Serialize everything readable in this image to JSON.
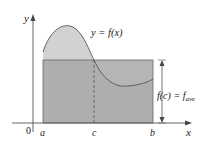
{
  "figure": {
    "curve_label": "y = f(x)",
    "height_label_main": "f(c) = f",
    "height_label_sub": "ave",
    "axis_x_label": "x",
    "axis_y_label": "y",
    "origin_label": "0",
    "tick_labels": [
      "a",
      "c",
      "b"
    ],
    "colors": {
      "rectangle_fill": "#a9a9a9",
      "curve_fill": "#cfcfcf",
      "lines": "#555555"
    }
  }
}
